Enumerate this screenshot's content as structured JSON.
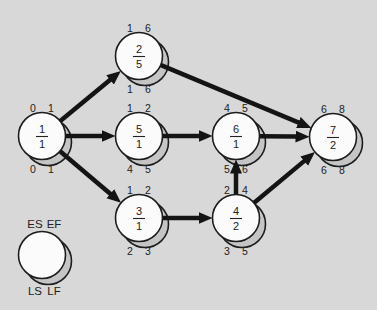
{
  "figure": {
    "type": "activity-on-node-network-diagram",
    "background_color": "#d8d8d8",
    "node_fill": "#fbfbfb",
    "node_shadow_fill": "#c5c5c5",
    "node_stroke": "#1c1c1c",
    "arrow_color": "#141414",
    "text_color": "#222222",
    "node_radius": 23.5,
    "shadow_offset": 6,
    "nodes": [
      {
        "id": "1",
        "activity": "1",
        "duration": "1",
        "x": 42,
        "y": 136,
        "es": "0",
        "ef": "1",
        "ls": "0",
        "lf": "1"
      },
      {
        "id": "2",
        "activity": "2",
        "duration": "5",
        "x": 139,
        "y": 56,
        "es": "1",
        "ef": "6",
        "ls": "1",
        "lf": "6"
      },
      {
        "id": "5",
        "activity": "5",
        "duration": "1",
        "x": 139,
        "y": 136,
        "es": "1",
        "ef": "2",
        "ls": "4",
        "lf": "5"
      },
      {
        "id": "3",
        "activity": "3",
        "duration": "1",
        "x": 139,
        "y": 218,
        "es": "1",
        "ef": "2",
        "ls": "2",
        "lf": "3"
      },
      {
        "id": "6",
        "activity": "6",
        "duration": "1",
        "x": 236,
        "y": 136,
        "es": "4",
        "ef": "5",
        "ls": "5",
        "lf": "6"
      },
      {
        "id": "4",
        "activity": "4",
        "duration": "2",
        "x": 236,
        "y": 218,
        "es": "2",
        "ef": "4",
        "ls": "3",
        "lf": "5"
      },
      {
        "id": "7",
        "activity": "7",
        "duration": "2",
        "x": 333,
        "y": 137,
        "es": "6",
        "ef": "8",
        "ls": "6",
        "lf": "8"
      }
    ],
    "edges": [
      {
        "from": "1",
        "to": "2"
      },
      {
        "from": "1",
        "to": "5"
      },
      {
        "from": "1",
        "to": "3"
      },
      {
        "from": "2",
        "to": "7"
      },
      {
        "from": "5",
        "to": "6"
      },
      {
        "from": "3",
        "to": "4"
      },
      {
        "from": "4",
        "to": "6"
      },
      {
        "from": "6",
        "to": "7"
      },
      {
        "from": "4",
        "to": "7"
      }
    ],
    "legend": {
      "x": 42,
      "y": 255,
      "top_labels": [
        "ES",
        "EF"
      ],
      "bottom_labels": [
        "LS",
        "LF"
      ]
    }
  }
}
